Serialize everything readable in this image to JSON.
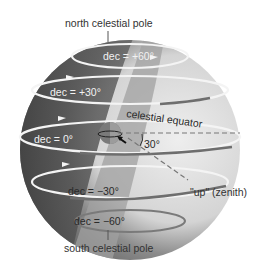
{
  "diagram": {
    "labels": {
      "north_pole": "north celestial pole",
      "south_pole": "south celestial pole",
      "equator": "celestial equator",
      "zenith": "\"up\" (zenith)",
      "angle": "30°"
    },
    "declination_circles": [
      {
        "label": "dec = +60°",
        "value": 60
      },
      {
        "label": "dec = +30°",
        "value": 30
      },
      {
        "label": "dec = 0°",
        "value": 0
      },
      {
        "label": "dec = −30°",
        "value": -30
      },
      {
        "label": "dec = −60°",
        "value": -60
      }
    ],
    "colors": {
      "sphere_dark": "#5a5a5a",
      "sphere_light": "#d8d8d8",
      "band": "#9a9a9a",
      "circle_light": "#f4f4f4",
      "circle_dark": "#6e6e6e",
      "text": "#333333"
    }
  }
}
